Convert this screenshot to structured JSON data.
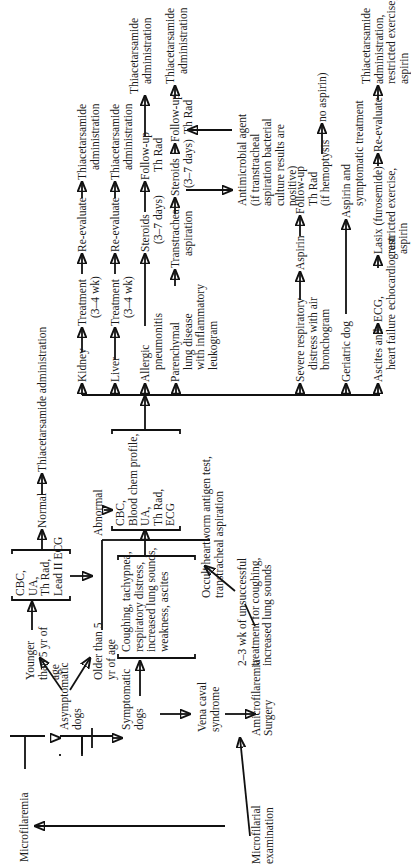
{
  "figure": {
    "orientation": "rotated-90-ccw",
    "nodes": {
      "microfilarial_examination": "Microfilarial examination",
      "microfilaremia": "Microfilaremia",
      "amicrofilaremia": "Amicrofilaremia",
      "asymptomatic_dogs": "Asymptomatic dogs",
      "symptomatic_dogs": "Symptomatic dogs",
      "vena_caval_syndrome": "Vena caval syndrome",
      "surgery": "Surgery",
      "younger_than_5": "Younger than 5 yr of age",
      "older_than_5": "Older than 5 yr of age",
      "symptoms_box": [
        "Coughing, tachypnea,",
        "respiratory distress,",
        "increased lung sounds,",
        "weakness, ascites"
      ],
      "occult_test": [
        "Occult heartworm antigen test,",
        "transtracheal aspiration"
      ],
      "unsuccessful_treatment": [
        "2–3 wk of unsuccessful",
        "treatment for coughing,",
        "increased lung sounds"
      ],
      "box_basic": [
        "CBC,",
        "UA,",
        "Th Rad,",
        "Lead II ECG"
      ],
      "normal": "Normal",
      "abnormal": "Abnormal",
      "thiacetarsamide_admin_line": "Thiacetarsamide administration",
      "box_full": [
        "CBC,",
        "Blood chem profile,",
        "UA,",
        "Th Rad,",
        "ECG"
      ],
      "kidney_row": {
        "start": "Kidney",
        "treatment": [
          "Treatment",
          "(3–4 wk)"
        ],
        "reevaluate": "Re-evaluate",
        "end": [
          "Thiacetarsamide",
          "administration"
        ]
      },
      "liver_row": {
        "start": "Liver",
        "treatment": [
          "Treatment",
          "(3–4 wk)"
        ],
        "reevaluate": "Re-evaluate",
        "end": [
          "Thiacetarsamide",
          "administration"
        ]
      },
      "allergic_row": {
        "start": [
          "Allergic",
          "pneumonitis"
        ],
        "steroids": [
          "Steroids",
          "(3–7 days)"
        ],
        "followup": [
          "Follow-up",
          "Th Rad"
        ],
        "end": [
          "Thiacetarsamide",
          "administration"
        ]
      },
      "parenchymal_row": {
        "start": [
          "Parenchymal",
          "lung disease",
          "with inflammatory",
          "leukogram"
        ],
        "aspiration": [
          "Transtracheal",
          "aspiration"
        ],
        "steroids": [
          "Steroids",
          "(3–7 days)"
        ],
        "followup": [
          "Follow-up",
          "Th Rad"
        ],
        "end": [
          "Thiacetarsamide",
          "administration"
        ],
        "antimicrobial": [
          "Antimicrobial agent",
          "(if transtracheal",
          "aspiration bacterial",
          "culture results are",
          "positive)"
        ]
      },
      "severe_row": {
        "start": [
          "Severe respiratory",
          "distress with air",
          "bronchogram"
        ],
        "aspirin": "Aspirin",
        "followup": [
          "Follow-up",
          "Th Rad",
          "(if hemoptysis"
        ],
        "end": "no aspirin)"
      },
      "geriatric_row": {
        "start": "Geriatric dog",
        "end": [
          "Aspirin and",
          "symptomatic treatment"
        ]
      },
      "ascites_row": {
        "start": [
          "Ascites and",
          "heart failure"
        ],
        "ecg": [
          "ECG,",
          "echocardiogram"
        ],
        "lasix": [
          "Lasix (furosemide)",
          "restricted exercise,",
          "aspirin"
        ],
        "reevaluate": "Re-evaluate",
        "end": [
          "Thiacetarsamide",
          "administration,",
          "restricted exercise,",
          "aspirin"
        ]
      }
    }
  }
}
